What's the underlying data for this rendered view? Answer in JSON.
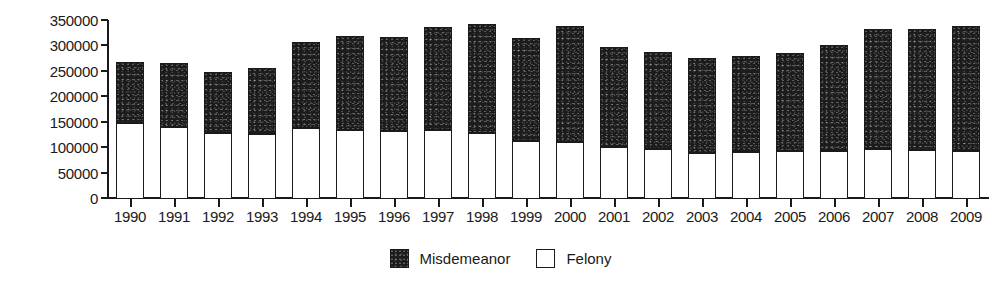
{
  "chart_data": {
    "type": "bar",
    "stacked": true,
    "title": "",
    "subtitle": "",
    "xlabel": "",
    "ylabel": "",
    "grid": false,
    "legend_position": "bottom-center",
    "ylim": [
      0,
      350000
    ],
    "ytick_step": 50000,
    "ytick_labels": [
      "350000",
      "300000",
      "250000",
      "200000",
      "150000",
      "100000",
      "50000",
      "0"
    ],
    "ytick_values": [
      350000,
      300000,
      250000,
      200000,
      150000,
      100000,
      50000,
      0
    ],
    "categories": [
      "1990",
      "1991",
      "1992",
      "1993",
      "1994",
      "1995",
      "1996",
      "1997",
      "1998",
      "1999",
      "2000",
      "2001",
      "2002",
      "2003",
      "2004",
      "2005",
      "2006",
      "2007",
      "2008",
      "2009"
    ],
    "series": [
      {
        "name": "Felony",
        "color": "#ffffff",
        "values": [
          148000,
          140000,
          128000,
          125000,
          137000,
          133000,
          131000,
          134000,
          128000,
          113000,
          111000,
          100000,
          96000,
          89000,
          90000,
          92000,
          93000,
          96000,
          95000,
          92000
        ]
      },
      {
        "name": "Misdemeanor",
        "color": "#1c1c1c",
        "values": [
          119000,
          125000,
          120000,
          130000,
          169000,
          186000,
          185000,
          202000,
          214000,
          201000,
          227000,
          196000,
          191000,
          187000,
          189000,
          194000,
          208000,
          236000,
          237000,
          246000
        ]
      }
    ],
    "totals": [
      267000,
      265000,
      248000,
      255000,
      306000,
      319000,
      316000,
      336000,
      342000,
      314000,
      338000,
      296000,
      287000,
      276000,
      279000,
      286000,
      301000,
      332000,
      332000,
      338000
    ]
  },
  "legend": {
    "items": [
      {
        "label": "Misdemeanor",
        "swatch": "black-filled-square"
      },
      {
        "label": "Felony",
        "swatch": "white-open-square"
      }
    ]
  }
}
